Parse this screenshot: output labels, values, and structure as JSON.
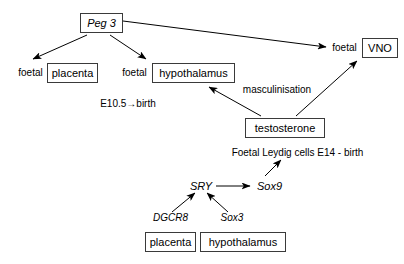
{
  "diagram": {
    "background_color": "#ffffff",
    "stroke_color": "#000000",
    "box_border_color": "#3a3a3a",
    "nodes": {
      "peg3": {
        "label": "Peg 3",
        "style": "boxed-italic"
      },
      "foetal_placenta_prefix": {
        "label": "foetal",
        "style": "plain"
      },
      "placenta_top": {
        "label": "placenta",
        "style": "boxed"
      },
      "foetal_hypothalamus_prefix": {
        "label": "foetal",
        "style": "plain"
      },
      "hypothalamus_top": {
        "label": "hypothalamus",
        "style": "boxed"
      },
      "foetal_vno_prefix": {
        "label": "foetal",
        "style": "plain"
      },
      "vno": {
        "label": "VNO",
        "style": "boxed"
      },
      "timing_peg3": {
        "label": "E10.5→birth",
        "style": "plain"
      },
      "masculinisation": {
        "label": "masculinisation",
        "style": "plain"
      },
      "testosterone": {
        "label": "testosterone",
        "style": "boxed"
      },
      "leydig": {
        "label": "Foetal Leydig cells E14 - birth",
        "style": "plain"
      },
      "sry": {
        "label": "SRY",
        "style": "plain-italic"
      },
      "sox9": {
        "label": "Sox9",
        "style": "plain-italic"
      },
      "dgcr8": {
        "label": "DGCR8",
        "style": "plain-italic"
      },
      "placenta_bottom": {
        "label": "placenta",
        "style": "boxed"
      },
      "sox3": {
        "label": "Sox3",
        "style": "plain-italic"
      },
      "hypothalamus_bottom": {
        "label": "hypothalamus",
        "style": "boxed"
      }
    },
    "edges": [
      {
        "name": "peg3-to-placenta",
        "from": "peg3",
        "to": "foetal_placenta_prefix"
      },
      {
        "name": "peg3-to-hypothalamus",
        "from": "peg3",
        "to": "foetal_hypothalamus_prefix"
      },
      {
        "name": "peg3-to-vno",
        "from": "peg3",
        "to": "foetal_vno_prefix"
      },
      {
        "name": "testosterone-to-hypothalamus",
        "from": "testosterone",
        "to": "hypothalamus_top",
        "label": "masculinisation"
      },
      {
        "name": "testosterone-to-vno",
        "from": "testosterone",
        "to": "vno"
      },
      {
        "name": "sox9-to-leydig",
        "from": "sox9",
        "to": "leydig"
      },
      {
        "name": "sry-to-sox9",
        "from": "sry",
        "to": "sox9"
      },
      {
        "name": "dgcr8-to-sry",
        "from": "dgcr8",
        "to": "sry"
      },
      {
        "name": "sox3-to-sry",
        "from": "sox3",
        "to": "sry"
      }
    ]
  }
}
